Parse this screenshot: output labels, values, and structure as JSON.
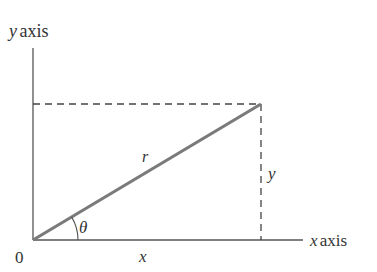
{
  "diagram": {
    "labels": {
      "y_axis_var": "y",
      "y_axis_word": "axis",
      "x_axis_var": "x",
      "x_axis_word": "axis",
      "origin": "0",
      "radius": "r",
      "angle": "θ",
      "x_leg": "x",
      "y_leg": "y"
    },
    "colors": {
      "axis": "#555555",
      "radius_line": "#7a7a7a",
      "dashed": "#444444",
      "text": "#333333"
    },
    "geometry": {
      "origin": [
        33,
        240
      ],
      "point": [
        261,
        104
      ],
      "x_axis_end": [
        303,
        240
      ],
      "y_axis_top": [
        33,
        48
      ]
    }
  }
}
